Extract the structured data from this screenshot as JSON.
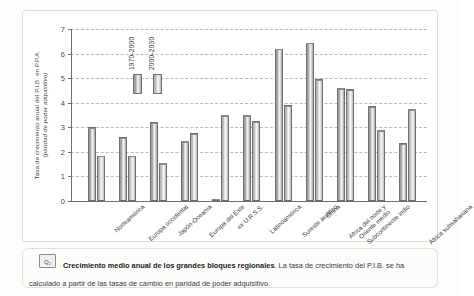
{
  "figure": {
    "badge": "Q₂",
    "caption_lead": "Crecimiento medio anual de los grandes bloques regionales",
    "caption_body": ". La tasa de crecimiento del P.I.B. se ha calculado a partir de las tasas de cambio en paridad de poder adquisitivo."
  },
  "chart_data": {
    "type": "bar",
    "title": "Crecimiento medio anual de los grandes bloques regionales",
    "xlabel": "",
    "ylabel": "Tasa de crecimiento anual del P.I.B. en P.P.A. (paridad de poder adquisitivo)",
    "ylabel_line1": "Tasa de crecimiento anual del P.I.B. en P.P.A.",
    "ylabel_line2": "(paridad de poder adquisitivo)",
    "ylim": [
      0,
      7
    ],
    "yticks": [
      0,
      1,
      2,
      3,
      4,
      5,
      6,
      7
    ],
    "ytick_labels": [
      "0",
      "1",
      "2",
      "3",
      "4",
      "5",
      "6",
      "7"
    ],
    "grid": true,
    "legend_position": "inside-top-left",
    "categories": [
      "Norteamérica",
      "Europa occidental",
      "Japón-Oceanía",
      "Europa del Este",
      "ex U.R.S.S.",
      "Latinoamérica",
      "Sureste asiático",
      "China",
      "Subcontinente indio",
      "África del norte y Oriente medio",
      "África subsahariana"
    ],
    "series": [
      {
        "name": "1970-2000",
        "color": "#b9b9b9",
        "values": [
          3.0,
          2.6,
          3.2,
          2.45,
          0.1,
          3.5,
          6.2,
          6.45,
          4.6,
          3.85,
          2.35
        ]
      },
      {
        "name": "2000-2030",
        "color": "#d8d8d8",
        "values": [
          1.85,
          1.85,
          1.55,
          2.75,
          3.5,
          3.25,
          3.9,
          4.95,
          4.55,
          2.9,
          3.75
        ]
      }
    ]
  }
}
